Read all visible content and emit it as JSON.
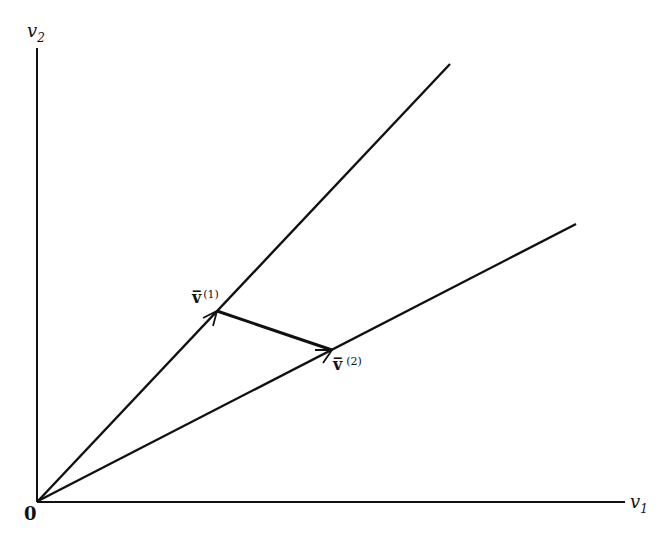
{
  "axes": {
    "y_label": "v",
    "y_sub": "2",
    "x_label": "v",
    "x_sub": "1",
    "origin_label": "0"
  },
  "rays": [
    {
      "name": "upper-ray",
      "from": [
        38,
        501
      ],
      "to": [
        450,
        64
      ]
    },
    {
      "name": "lower-ray",
      "from": [
        38,
        501
      ],
      "to": [
        576,
        224
      ]
    }
  ],
  "points": {
    "v1": {
      "symbol": "v̅",
      "sup": "(1)",
      "pos": [
        217,
        311
      ]
    },
    "v2": {
      "symbol": "v̅",
      "sup": "(2)",
      "pos": [
        332,
        350
      ]
    }
  },
  "colors": {
    "ink": "#111111",
    "background": "#ffffff"
  }
}
